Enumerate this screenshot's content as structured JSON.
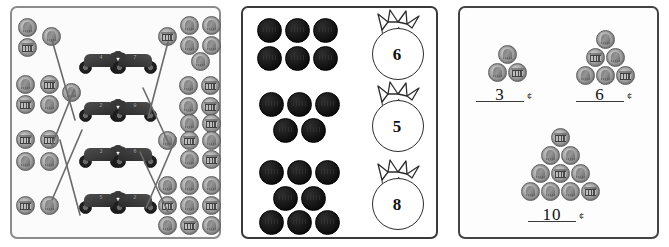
{
  "worksheet": {
    "title": "Counting Coins Worksheet",
    "panels": [
      {
        "id": "panel-matching",
        "name": "match-coin-groups-to-motorcycles",
        "type": "matching",
        "left_groups": [
          {
            "id": "L1",
            "count": 3,
            "coin": "penny"
          },
          {
            "id": "L2",
            "count": 5,
            "coin": "penny"
          },
          {
            "id": "L3",
            "count": 4,
            "coin": "penny"
          },
          {
            "id": "L4",
            "count": 2,
            "coin": "penny"
          }
        ],
        "right_groups": [
          {
            "id": "R1",
            "count": 6,
            "coin": "penny"
          },
          {
            "id": "R2",
            "count": 4,
            "coin": "penny"
          },
          {
            "id": "R3",
            "count": 7,
            "coin": "penny"
          },
          {
            "id": "R4",
            "count": 9,
            "coin": "penny"
          }
        ],
        "motorcycles": [
          {
            "id": "M1",
            "label": "4",
            "row": 1,
            "side": "left"
          },
          {
            "id": "M2",
            "label": "7",
            "row": 1,
            "side": "right"
          },
          {
            "id": "M3",
            "label": "2",
            "row": 2,
            "side": "left"
          },
          {
            "id": "M4",
            "label": "9",
            "row": 2,
            "side": "right"
          },
          {
            "id": "M5",
            "label": "3",
            "row": 3,
            "side": "left"
          },
          {
            "id": "M6",
            "label": "6",
            "row": 3,
            "side": "right"
          },
          {
            "id": "M7",
            "label": "5",
            "row": 4,
            "side": "left"
          },
          {
            "id": "M8",
            "label": "2",
            "row": 4,
            "side": "right"
          }
        ],
        "connector_count": 8
      },
      {
        "id": "panel-bags",
        "name": "match-coin-groups-to-bags",
        "type": "matching",
        "coin_groups": [
          {
            "id": "G1",
            "count": 6,
            "rows": [
              3,
              3
            ],
            "coin": "solid"
          },
          {
            "id": "G2",
            "count": 5,
            "rows": [
              3,
              2
            ],
            "coin": "solid"
          },
          {
            "id": "G3",
            "count": 8,
            "rows": [
              3,
              2,
              3
            ],
            "coin": "solid"
          }
        ],
        "bags": [
          {
            "id": "B1",
            "label": "6"
          },
          {
            "id": "B2",
            "label": "5"
          },
          {
            "id": "B3",
            "label": "8"
          }
        ]
      },
      {
        "id": "panel-count-write",
        "name": "count-and-write-value",
        "type": "fill-in",
        "items": [
          {
            "id": "T1",
            "count": 3,
            "rows": [
              1,
              2
            ],
            "answer": "3",
            "unit": "¢",
            "coin": "penny"
          },
          {
            "id": "T2",
            "count": 6,
            "rows": [
              1,
              2,
              3
            ],
            "answer": "6",
            "unit": "¢",
            "coin": "penny"
          },
          {
            "id": "T3",
            "count": 10,
            "rows": [
              1,
              2,
              3,
              4
            ],
            "answer": "10",
            "unit": "¢",
            "coin": "penny"
          }
        ]
      }
    ],
    "colors": {
      "page_background": "#ffffff",
      "panel_border_light": "#8b8b8b",
      "panel_border_dark": "#3a3a3a",
      "coin_solid": "#111111",
      "coin_penny": "#a9a9a9",
      "ink": "#222222"
    }
  }
}
